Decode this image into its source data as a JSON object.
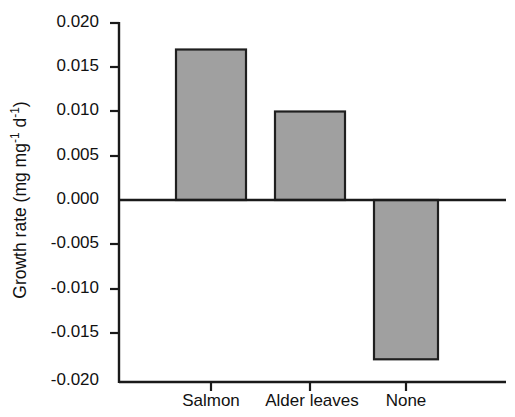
{
  "chart_data": {
    "type": "bar",
    "title": "",
    "xlabel": "",
    "ylabel": "Growth rate (mg mg-1 d-1)",
    "ylabel_parts": {
      "prefix": "Growth rate (mg mg",
      "sup1": "-1",
      "mid": " d",
      "sup2": "-1",
      "suffix": ")"
    },
    "categories": [
      "Salmon",
      "Alder leaves",
      "None"
    ],
    "values": [
      0.017,
      0.01,
      -0.018
    ],
    "ylim": [
      -0.02,
      0.02
    ],
    "yticks": [
      0.02,
      0.015,
      0.01,
      0.005,
      0.0,
      -0.005,
      -0.01,
      -0.015,
      -0.02
    ],
    "ytick_labels": [
      "0.020",
      "0.015",
      "0.010",
      "0.005",
      "0.000",
      "-0.005",
      "-0.010",
      "-0.015",
      "-0.020"
    ],
    "grid": false,
    "legend": null,
    "bar_fill_color": "#a0a0a0",
    "bar_edge_color": "#1f1f1f",
    "axis_color": "#1a1a1a",
    "background_color": "#ffffff",
    "zero_line_value": 0.0
  }
}
